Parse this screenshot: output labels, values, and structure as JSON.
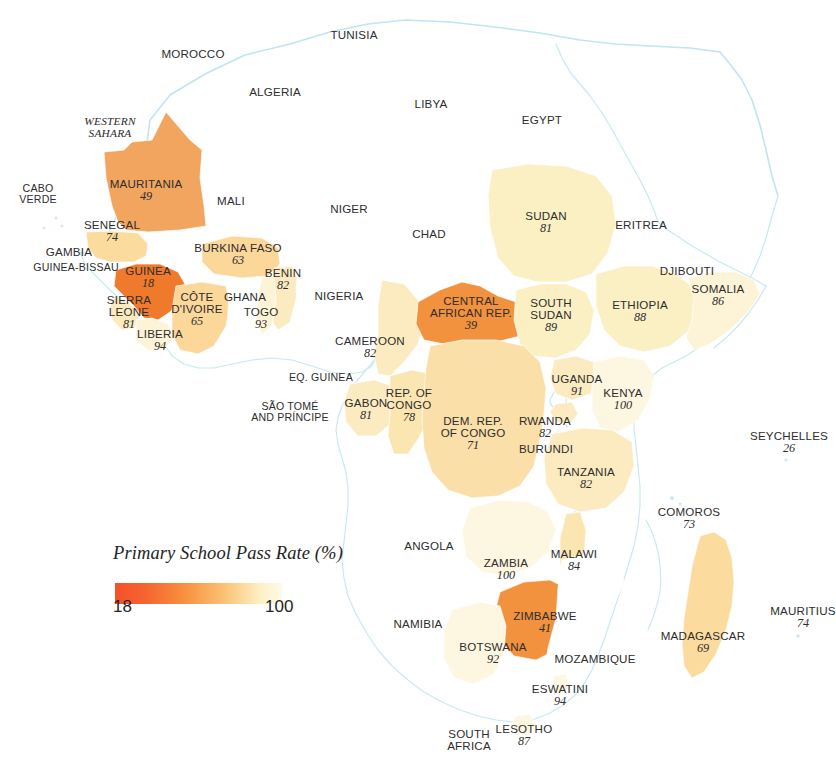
{
  "legend": {
    "title": "Primary School Pass Rate (%)",
    "min": "18",
    "max": "100",
    "ramp_low_color": "#F4502A",
    "ramp_mid_color": "#F79A3E",
    "ramp_high_color": "#FDF6DC"
  },
  "chart_data": {
    "type": "choropleth-map",
    "title": "Primary School Pass Rate (%)",
    "value_unit": "percent",
    "value_range": [
      18,
      100
    ],
    "colormap": "orange-to-cream (low = deep orange/red, high = pale cream)",
    "region": "Africa",
    "legend_position": "lower-left",
    "countries": [
      {
        "name": "MOROCCO",
        "value": null,
        "x": 193,
        "y": 54
      },
      {
        "name": "TUNISIA",
        "value": null,
        "x": 354,
        "y": 35
      },
      {
        "name": "ALGERIA",
        "value": null,
        "x": 275,
        "y": 92
      },
      {
        "name": "LIBYA",
        "value": null,
        "x": 431,
        "y": 104
      },
      {
        "name": "EGYPT",
        "value": null,
        "x": 542,
        "y": 120
      },
      {
        "name": "WESTERN SAHARA",
        "value": null,
        "x": 110,
        "y": 128
      },
      {
        "name": "MAURITANIA",
        "value": 49,
        "x": 146,
        "y": 190
      },
      {
        "name": "MALI",
        "value": null,
        "x": 231,
        "y": 201
      },
      {
        "name": "NIGER",
        "value": null,
        "x": 349,
        "y": 209
      },
      {
        "name": "CHAD",
        "value": null,
        "x": 429,
        "y": 234
      },
      {
        "name": "SUDAN",
        "value": 81,
        "x": 546,
        "y": 222
      },
      {
        "name": "ERITREA",
        "value": null,
        "x": 641,
        "y": 225
      },
      {
        "name": "CABO VERDE",
        "value": null,
        "x": 38,
        "y": 194
      },
      {
        "name": "SENEGAL",
        "value": 74,
        "x": 112,
        "y": 231
      },
      {
        "name": "GAMBIA",
        "value": null,
        "x": 69,
        "y": 252
      },
      {
        "name": "GUINEA-BISSAU",
        "value": null,
        "x": 76,
        "y": 268
      },
      {
        "name": "BURKINA FASO",
        "value": 63,
        "x": 238,
        "y": 254
      },
      {
        "name": "BENIN",
        "value": 82,
        "x": 283,
        "y": 279
      },
      {
        "name": "GUINEA",
        "value": 18,
        "x": 148,
        "y": 277
      },
      {
        "name": "CÔTE D'IVOIRE",
        "value": 65,
        "x": 197,
        "y": 309
      },
      {
        "name": "GHANA",
        "value": null,
        "x": 245,
        "y": 297
      },
      {
        "name": "TOGO",
        "value": 93,
        "x": 261,
        "y": 318
      },
      {
        "name": "NIGERIA",
        "value": null,
        "x": 339,
        "y": 296
      },
      {
        "name": "SIERRA LEONE",
        "value": 81,
        "x": 129,
        "y": 312
      },
      {
        "name": "LIBERIA",
        "value": 94,
        "x": 160,
        "y": 340
      },
      {
        "name": "DJIBOUTI",
        "value": null,
        "x": 687,
        "y": 271
      },
      {
        "name": "SOMALIA",
        "value": 86,
        "x": 718,
        "y": 295
      },
      {
        "name": "ETHIOPIA",
        "value": 88,
        "x": 640,
        "y": 311
      },
      {
        "name": "CENTRAL AFRICAN REP.",
        "value": 39,
        "x": 471,
        "y": 313
      },
      {
        "name": "SOUTH SUDAN",
        "value": 89,
        "x": 551,
        "y": 315
      },
      {
        "name": "CAMEROON",
        "value": 82,
        "x": 370,
        "y": 347
      },
      {
        "name": "EQ. GUINEA",
        "value": null,
        "x": 321,
        "y": 378
      },
      {
        "name": "SÃO TOMÉ AND PRÍNCIPE",
        "value": null,
        "x": 290,
        "y": 412
      },
      {
        "name": "GABON",
        "value": 81,
        "x": 366,
        "y": 409
      },
      {
        "name": "REP. OF CONGO",
        "value": 78,
        "x": 409,
        "y": 405
      },
      {
        "name": "DEM. REP. OF CONGO",
        "value": 71,
        "x": 473,
        "y": 433
      },
      {
        "name": "UGANDA",
        "value": 91,
        "x": 577,
        "y": 385
      },
      {
        "name": "KENYA",
        "value": 100,
        "x": 623,
        "y": 399
      },
      {
        "name": "RWANDA",
        "value": 82,
        "x": 545,
        "y": 427
      },
      {
        "name": "BURUNDI",
        "value": null,
        "x": 546,
        "y": 449
      },
      {
        "name": "TANZANIA",
        "value": 82,
        "x": 586,
        "y": 478
      },
      {
        "name": "SEYCHELLES",
        "value": 26,
        "x": 789,
        "y": 442
      },
      {
        "name": "COMOROS",
        "value": 73,
        "x": 689,
        "y": 518
      },
      {
        "name": "ANGOLA",
        "value": null,
        "x": 429,
        "y": 546
      },
      {
        "name": "ZAMBIA",
        "value": 100,
        "x": 506,
        "y": 569
      },
      {
        "name": "MALAWI",
        "value": 84,
        "x": 574,
        "y": 560
      },
      {
        "name": "ZIMBABWE",
        "value": 41,
        "x": 545,
        "y": 622
      },
      {
        "name": "BOTSWANA",
        "value": 92,
        "x": 493,
        "y": 653
      },
      {
        "name": "NAMIBIA",
        "value": null,
        "x": 418,
        "y": 624
      },
      {
        "name": "MOZAMBIQUE",
        "value": null,
        "x": 595,
        "y": 659
      },
      {
        "name": "MADAGASCAR",
        "value": 69,
        "x": 703,
        "y": 642
      },
      {
        "name": "MAURITIUS",
        "value": 74,
        "x": 803,
        "y": 617
      },
      {
        "name": "ESWATINI",
        "value": 94,
        "x": 560,
        "y": 695
      },
      {
        "name": "LESOTHO",
        "value": 87,
        "x": 524,
        "y": 735
      },
      {
        "name": "SOUTH AFRICA",
        "value": null,
        "x": 469,
        "y": 740
      }
    ]
  }
}
